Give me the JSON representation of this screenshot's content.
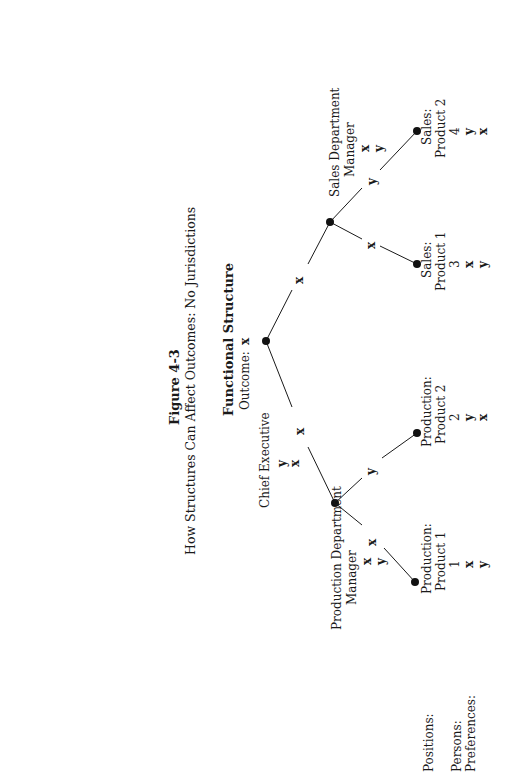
{
  "figure": {
    "number": "Figure 4-3",
    "caption": "How Structures Can Affect Outcomes: No Jurisdictions"
  },
  "structure": {
    "title": "Functional Structure",
    "outcome_label": "Outcome:",
    "outcome_value": "x"
  },
  "chief_executive": {
    "label": "Chief Executive",
    "preferences": [
      "y",
      "x"
    ]
  },
  "edges": {
    "root_to_production": "x",
    "root_to_sales": "x",
    "production_to_p1": "x",
    "production_to_p2": "y",
    "sales_to_s1": "x",
    "sales_to_s2": "y"
  },
  "production_manager": {
    "label_line1": "Production Department",
    "label_line2": "Manager",
    "preferences": [
      "x",
      "y"
    ]
  },
  "sales_manager": {
    "label_line1": "Sales Department",
    "label_line2": "Manager",
    "preferences": [
      "x",
      "y"
    ]
  },
  "row_labels": {
    "positions": "Positions:",
    "persons": "Persons:",
    "preferences": "Preferences:"
  },
  "leaves": [
    {
      "position_line1": "Production:",
      "position_line2": "Product 1",
      "person": "1",
      "preferences": [
        "x",
        "y"
      ]
    },
    {
      "position_line1": "Production:",
      "position_line2": "Product 2",
      "person": "2",
      "preferences": [
        "y",
        "x"
      ]
    },
    {
      "position_line1": "Sales:",
      "position_line2": "Product 1",
      "person": "3",
      "preferences": [
        "x",
        "y"
      ]
    },
    {
      "position_line1": "Sales:",
      "position_line2": "Product 2",
      "person": "4",
      "preferences": [
        "y",
        "x"
      ]
    }
  ]
}
